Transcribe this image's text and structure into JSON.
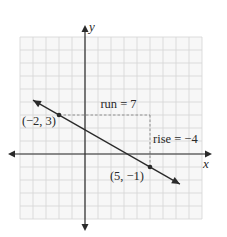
{
  "chart_data": {
    "type": "line",
    "title": "",
    "xlabel": "x",
    "ylabel": "y",
    "xlim": [
      -5,
      9
    ],
    "ylim": [
      -5,
      9
    ],
    "grid": true,
    "series": [
      {
        "name": "line",
        "slope": -0.5714,
        "intercept": 1.857,
        "x_range": [
          -4,
          7.3
        ],
        "points": [
          {
            "x": -2,
            "y": 3,
            "label": "(−2, 3)"
          },
          {
            "x": 5,
            "y": -1,
            "label": "(5, −1)"
          }
        ]
      }
    ],
    "annotations": [
      {
        "type": "run",
        "text": "run = 7",
        "from": [
          -2,
          3
        ],
        "to": [
          5,
          3
        ]
      },
      {
        "type": "rise",
        "text": "rise = −4",
        "from": [
          5,
          3
        ],
        "to": [
          5,
          -1
        ]
      }
    ],
    "colors": {
      "grid": "#d4d4d4",
      "axis": "#2a2a2a",
      "line": "#2a2a2a",
      "dashed": "#888888",
      "background": "#f7f7f7"
    }
  }
}
